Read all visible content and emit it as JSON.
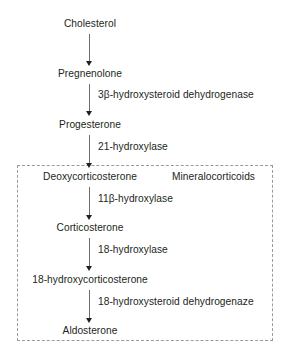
{
  "diagram": {
    "accent_color": "#231f20",
    "arrow_color": "#6e6e6e",
    "group_border_color": "#9a9a9a",
    "nodes": [
      {
        "id": "cholesterol",
        "label": "Cholesterol"
      },
      {
        "id": "pregnenolone",
        "label": "Pregnenolone"
      },
      {
        "id": "progesterone",
        "label": "Progesterone"
      },
      {
        "id": "deoxycorticosterone",
        "label": "Deoxycorticosterone"
      },
      {
        "id": "corticosterone",
        "label": "Corticosterone"
      },
      {
        "id": "18-hydroxycorticosterone",
        "label": "18-hydroxycorticosterone"
      },
      {
        "id": "aldosterone",
        "label": "Aldosterone"
      }
    ],
    "enzymes": [
      {
        "id": "step-1",
        "label": ""
      },
      {
        "id": "step-2",
        "label": "3β-hydroxysteroid dehydrogenase"
      },
      {
        "id": "step-3",
        "label": "21-hydroxylase"
      },
      {
        "id": "step-4",
        "label": "11β-hydroxylase"
      },
      {
        "id": "step-5",
        "label": "18-hydroxylase"
      },
      {
        "id": "step-6",
        "label": "18-hydroxysteroid dehydrogenaze"
      }
    ],
    "group": {
      "label": "Mineralocorticoids"
    }
  }
}
